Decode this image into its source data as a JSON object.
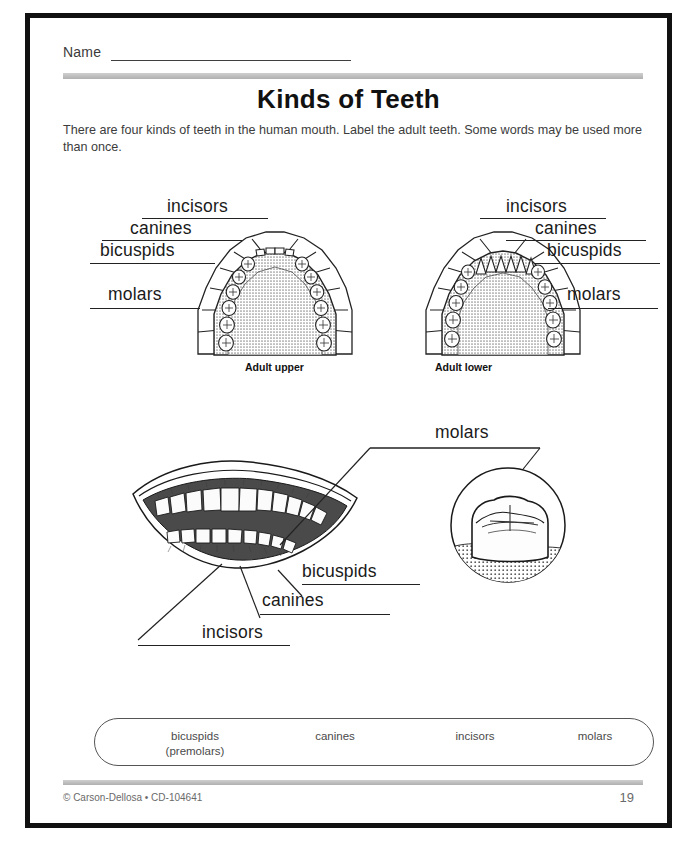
{
  "page": {
    "name_label": "Name",
    "title": "Kinds of Teeth",
    "instructions": "There are four kinds of teeth in the human mouth. Label the adult teeth. Some words may be used more than once."
  },
  "diagrams": {
    "upper": {
      "caption": "Adult upper",
      "labels": [
        {
          "text": "incisors"
        },
        {
          "text": "canines"
        },
        {
          "text": "bicuspids"
        },
        {
          "text": "molars"
        }
      ]
    },
    "lower": {
      "caption": "Adult lower",
      "labels": [
        {
          "text": "incisors"
        },
        {
          "text": "canines"
        },
        {
          "text": "bicuspids"
        },
        {
          "text": "molars"
        }
      ]
    },
    "mouth": {
      "labels": [
        {
          "text": "bicuspids"
        },
        {
          "text": "canines"
        },
        {
          "text": "incisors"
        }
      ]
    },
    "molar_closeup": {
      "label": "molars"
    }
  },
  "word_bank": {
    "items": [
      {
        "line1": "bicuspids",
        "line2": "(premolars)"
      },
      {
        "line1": "canines",
        "line2": ""
      },
      {
        "line1": "incisors",
        "line2": ""
      },
      {
        "line1": "molars",
        "line2": ""
      }
    ]
  },
  "footer": {
    "credit": "© Carson-Dellosa • CD-104641",
    "page_number": "19"
  },
  "colors": {
    "ink": "#1a1a1a",
    "rule": "#b0b0b0",
    "palate": "#b9b9b9",
    "tooth": "#fdfdfd",
    "frame": "#111111"
  }
}
